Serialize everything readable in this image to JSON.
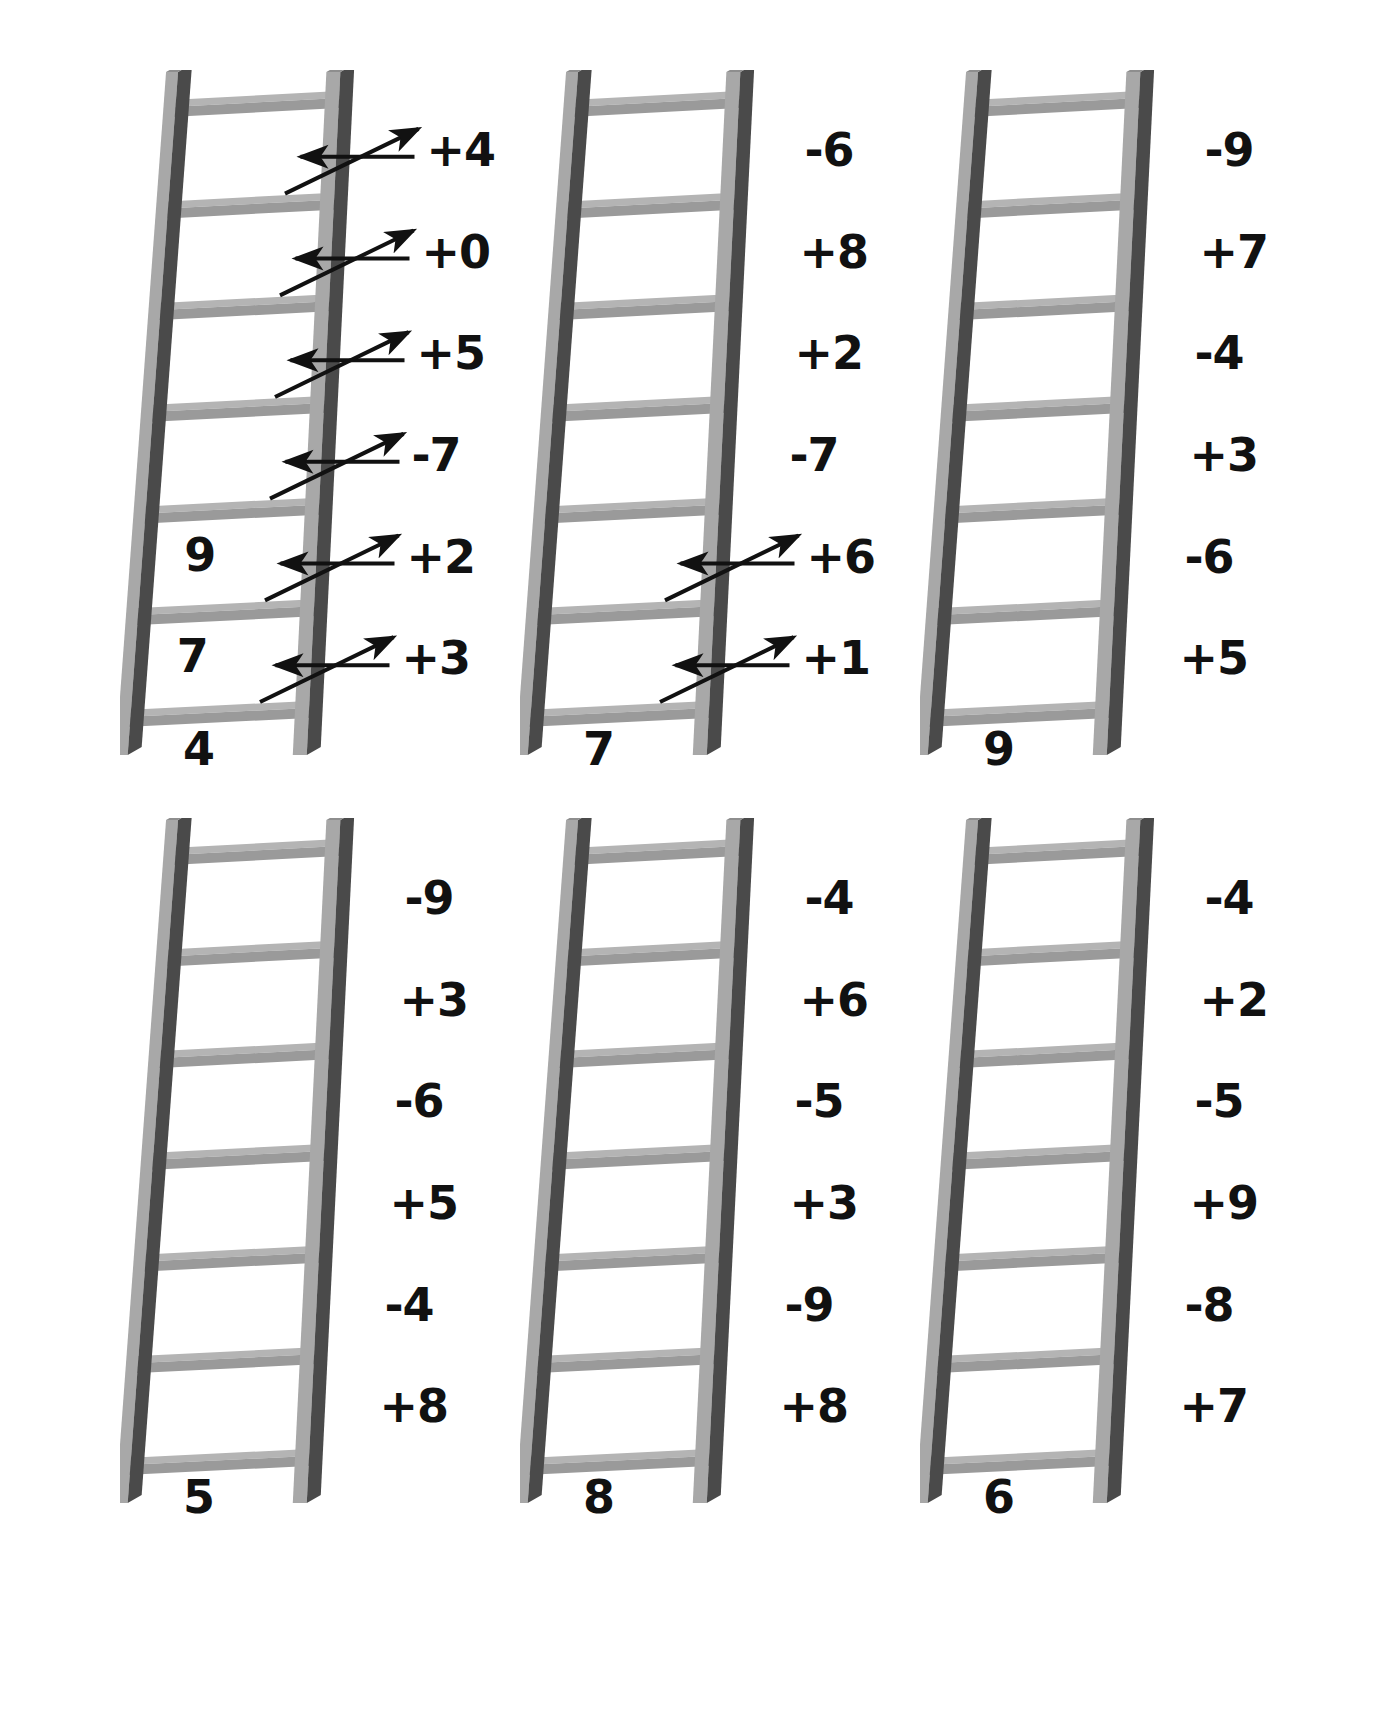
{
  "worksheet": {
    "background_color": "#ffffff",
    "ink_color": "#111111",
    "rail_light_color": "#a8a8a8",
    "rail_dark_color": "#4a4a4a",
    "rung_color": "#a0a0a0"
  },
  "ladders": [
    {
      "id": "ladder-1",
      "start_value": "4",
      "operations": [
        "+4",
        "+0",
        "+5",
        "-7",
        "+2",
        "+3"
      ],
      "filled_answers": [
        "",
        "",
        "",
        "",
        "9",
        "7"
      ],
      "has_arrows": true,
      "arrow_count": 6
    },
    {
      "id": "ladder-2",
      "start_value": "7",
      "operations": [
        "-6",
        "+8",
        "+2",
        "-7",
        "+6",
        "+1"
      ],
      "filled_answers": [
        "",
        "",
        "",
        "",
        "",
        ""
      ],
      "has_arrows": true,
      "arrow_count": 2
    },
    {
      "id": "ladder-3",
      "start_value": "9",
      "operations": [
        "-9",
        "+7",
        "-4",
        "+3",
        "-6",
        "+5"
      ],
      "filled_answers": [
        "",
        "",
        "",
        "",
        "",
        ""
      ],
      "has_arrows": false,
      "arrow_count": 0
    },
    {
      "id": "ladder-4",
      "start_value": "5",
      "operations": [
        "-9",
        "+3",
        "-6",
        "+5",
        "-4",
        "+8"
      ],
      "filled_answers": [
        "",
        "",
        "",
        "",
        "",
        ""
      ],
      "has_arrows": false,
      "arrow_count": 0
    },
    {
      "id": "ladder-5",
      "start_value": "8",
      "operations": [
        "-4",
        "+6",
        "-5",
        "+3",
        "-9",
        "+8"
      ],
      "filled_answers": [
        "",
        "",
        "",
        "",
        "",
        ""
      ],
      "has_arrows": false,
      "arrow_count": 0
    },
    {
      "id": "ladder-6",
      "start_value": "6",
      "operations": [
        "-4",
        "+2",
        "-5",
        "+9",
        "-8",
        "+7"
      ],
      "filled_answers": [
        "",
        "",
        "",
        "",
        "",
        ""
      ],
      "has_arrows": false,
      "arrow_count": 0
    }
  ],
  "chart_data": {
    "type": "table",
    "title": "",
    "columns": [
      "ladder",
      "start",
      "op1",
      "op2",
      "op3",
      "op4",
      "op5",
      "op6"
    ],
    "rows": [
      [
        "ladder-1",
        "4",
        "+3",
        "+2",
        "-7",
        "+5",
        "+0",
        "+4"
      ],
      [
        "ladder-2",
        "7",
        "+1",
        "+6",
        "-7",
        "+2",
        "+8",
        "-6"
      ],
      [
        "ladder-3",
        "9",
        "+5",
        "-6",
        "+3",
        "-4",
        "+7",
        "-9"
      ],
      [
        "ladder-4",
        "5",
        "+8",
        "-4",
        "+5",
        "-6",
        "+3",
        "-9"
      ],
      [
        "ladder-5",
        "8",
        "+8",
        "-9",
        "+3",
        "-5",
        "+6",
        "-4"
      ],
      [
        "ladder-6",
        "6",
        "+7",
        "-8",
        "+9",
        "-5",
        "+2",
        "-4"
      ]
    ]
  }
}
